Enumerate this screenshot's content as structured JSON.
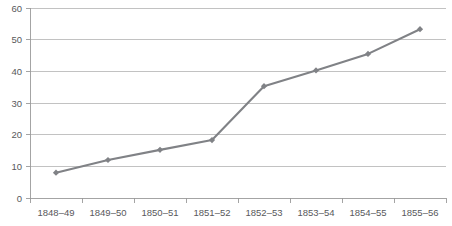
{
  "chart_data": {
    "type": "line",
    "title": "",
    "subtitle": "",
    "xlabel": "",
    "ylabel": "",
    "categories": [
      "1848–49",
      "1849–50",
      "1850–51",
      "1851–52",
      "1852–53",
      "1853–54",
      "1854–55",
      "1855–56"
    ],
    "values": [
      8,
      12,
      15.2,
      18.3,
      35.3,
      40.3,
      45.5,
      53.3
    ],
    "series": [
      {
        "name": "",
        "values": [
          8,
          12,
          15.2,
          18.3,
          35.3,
          40.3,
          45.5,
          53.3
        ]
      }
    ],
    "ylim": [
      0,
      60
    ],
    "yticks": [
      0,
      10,
      20,
      30,
      40,
      50,
      60
    ],
    "ytick_labels": [
      "0",
      "10",
      "20",
      "30",
      "40",
      "50",
      "60"
    ],
    "xtick_labels": [
      "1848–49",
      "1849–50",
      "1850–51",
      "1851–52",
      "1852–53",
      "1853–54",
      "1854–55",
      "1855–56"
    ],
    "grid": true,
    "grid_axis": "y",
    "legend": false,
    "legend_position": "none",
    "annotations": [],
    "colors": {
      "line": "#808286",
      "marker": "#808286",
      "gridline": "#b3b3b3",
      "axis": "#9a9a9a",
      "tick_text": "#58595b",
      "background": "#ffffff"
    },
    "marker_shape": "diamond"
  }
}
